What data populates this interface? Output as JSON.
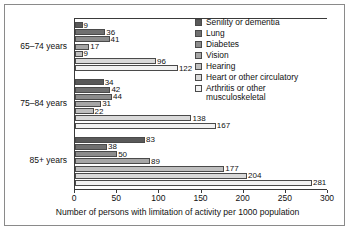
{
  "chart_data": {
    "type": "bar",
    "orientation": "horizontal",
    "title": "",
    "xlabel": "Number of persons with limitation of activity per 1000 population",
    "ylabel": "",
    "xlim": [
      0,
      300
    ],
    "xticks": [
      0,
      50,
      100,
      150,
      200,
      250,
      300
    ],
    "grid": false,
    "legend_position": "top-right",
    "categories": [
      "65–74 years",
      "75–84 years",
      "85+ years"
    ],
    "series": [
      {
        "name": "Senility or dementia",
        "color": "#595959",
        "values": [
          9,
          34,
          83
        ]
      },
      {
        "name": "Lung",
        "color": "#707070",
        "values": [
          36,
          42,
          38
        ]
      },
      {
        "name": "Diabetes",
        "color": "#8c8c8c",
        "values": [
          41,
          44,
          50
        ]
      },
      {
        "name": "Vision",
        "color": "#a6a6a6",
        "values": [
          17,
          31,
          89
        ]
      },
      {
        "name": "Hearing",
        "color": "#bfbfbf",
        "values": [
          9,
          22,
          177
        ]
      },
      {
        "name": "Heart or other circulatory",
        "color": "#d9d9d9",
        "values": [
          96,
          138,
          204
        ]
      },
      {
        "name": "Arthritis or other musculoskeletal",
        "color": "#f2f2f2",
        "values": [
          122,
          167,
          281
        ]
      }
    ]
  },
  "legend": {
    "items": [
      {
        "label": "Senility or dementia"
      },
      {
        "label": "Lung"
      },
      {
        "label": "Diabetes"
      },
      {
        "label": "Vision"
      },
      {
        "label": "Hearing"
      },
      {
        "label": "Heart or other circulatory"
      },
      {
        "label": "Arthritis or other musculoskeletal"
      }
    ]
  }
}
